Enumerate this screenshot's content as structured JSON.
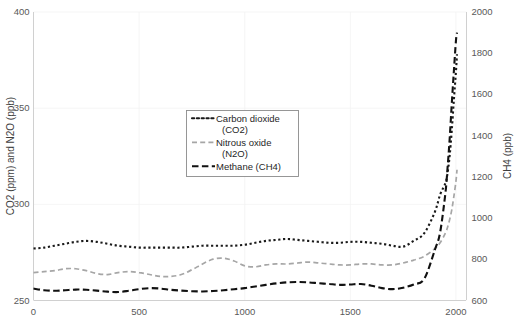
{
  "chart_data": {
    "type": "line",
    "title": "",
    "subtitle": "",
    "xlabel": "",
    "ylabel": "CO2 (ppm) and N2O (ppb)",
    "y2label": "CH4 (ppb)",
    "grid": true,
    "legend_position": "center",
    "xlim": [
      0,
      2050
    ],
    "ylim": [
      250,
      400
    ],
    "y2lim": [
      600,
      2000
    ],
    "xticks": [
      0,
      500,
      1000,
      1500,
      2000
    ],
    "yticks": [
      250,
      300,
      350,
      400
    ],
    "y2ticks": [
      600,
      800,
      1000,
      1200,
      1400,
      1600,
      1800,
      2000
    ],
    "xtick_labels": [
      "0",
      "500",
      "1000",
      "1500",
      "2000"
    ],
    "ytick_labels": [
      "250",
      "300",
      "350",
      "400"
    ],
    "y2tick_labels": [
      "600",
      "800",
      "1000",
      "1200",
      "1400",
      "1600",
      "1800",
      "2000"
    ],
    "series": [
      {
        "name": "Carbon dioxide (CO2)",
        "axis": "left",
        "unit": "ppm",
        "color": "#1a1a1a",
        "style": "dotted",
        "x": [
          0,
          50,
          100,
          150,
          200,
          250,
          300,
          350,
          400,
          450,
          500,
          550,
          600,
          650,
          700,
          750,
          800,
          850,
          900,
          950,
          1000,
          1050,
          1100,
          1150,
          1200,
          1250,
          1300,
          1350,
          1400,
          1450,
          1500,
          1550,
          1600,
          1650,
          1700,
          1750,
          1800,
          1850,
          1900,
          1925,
          1950,
          1960,
          1970,
          1980,
          1990,
          2000,
          2005
        ],
        "values": [
          277,
          277.5,
          278.5,
          279.5,
          280.5,
          281,
          280.5,
          279.5,
          278.5,
          278,
          277.5,
          277.5,
          277.5,
          277.5,
          277.5,
          278,
          278.5,
          278.5,
          278.5,
          278.5,
          279,
          280,
          281,
          281.5,
          282,
          281.5,
          281,
          280.5,
          280,
          280,
          280.5,
          280.5,
          280,
          279.5,
          278.5,
          278,
          281,
          285,
          296,
          305,
          311,
          316,
          325,
          338,
          354,
          369,
          378
        ]
      },
      {
        "name": "Nitrous oxide (N2O)",
        "axis": "left",
        "unit": "ppb",
        "color": "#a6a6a6",
        "style": "dashed",
        "x": [
          0,
          50,
          100,
          150,
          200,
          250,
          300,
          350,
          400,
          450,
          500,
          550,
          600,
          650,
          700,
          750,
          800,
          850,
          900,
          950,
          1000,
          1050,
          1100,
          1150,
          1200,
          1250,
          1300,
          1350,
          1400,
          1450,
          1500,
          1550,
          1600,
          1650,
          1700,
          1750,
          1800,
          1850,
          1900,
          1925,
          1950,
          1960,
          1970,
          1980,
          1990,
          2000,
          2005
        ],
        "values": [
          264.5,
          265,
          265.5,
          266.5,
          266.5,
          265.5,
          264,
          263.5,
          264.5,
          265,
          264.5,
          263.5,
          262.5,
          262.5,
          263.5,
          266,
          269,
          271.5,
          272,
          270.5,
          268,
          267.5,
          268.5,
          269,
          269,
          269.5,
          270,
          269.5,
          269,
          268.5,
          268.5,
          269,
          269,
          268.5,
          268.5,
          269.5,
          271,
          273,
          277,
          280,
          285,
          288,
          292,
          297,
          304,
          312,
          318
        ]
      },
      {
        "name": "Methane (CH4)",
        "axis": "right",
        "unit": "ppb",
        "color": "#111111",
        "style": "dashdot",
        "x": [
          0,
          50,
          100,
          150,
          200,
          250,
          300,
          350,
          400,
          450,
          500,
          550,
          600,
          650,
          700,
          750,
          800,
          850,
          900,
          950,
          1000,
          1050,
          1100,
          1150,
          1200,
          1250,
          1300,
          1350,
          1400,
          1450,
          1500,
          1550,
          1600,
          1650,
          1700,
          1750,
          1800,
          1850,
          1900,
          1925,
          1950,
          1960,
          1970,
          1980,
          1990,
          2000,
          2005
        ],
        "values": [
          658,
          650,
          647,
          650,
          653,
          652,
          648,
          643,
          641,
          647,
          655,
          660,
          658,
          652,
          648,
          645,
          644,
          646,
          650,
          655,
          660,
          668,
          676,
          683,
          688,
          690,
          688,
          684,
          680,
          676,
          678,
          680,
          672,
          660,
          655,
          662,
          678,
          705,
          845,
          930,
          1120,
          1240,
          1380,
          1550,
          1710,
          1860,
          1900
        ]
      }
    ],
    "annotations": []
  },
  "legend": {
    "entries": [
      {
        "label_line1": "Carbon dioxide",
        "label_line2": "(CO2)",
        "style": "dotted"
      },
      {
        "label_line1": "Nitrous oxide",
        "label_line2": "(N2O)",
        "style": "dashed"
      },
      {
        "label_line1": "Methane (CH4)",
        "label_line2": "",
        "style": "dashdot"
      }
    ]
  }
}
